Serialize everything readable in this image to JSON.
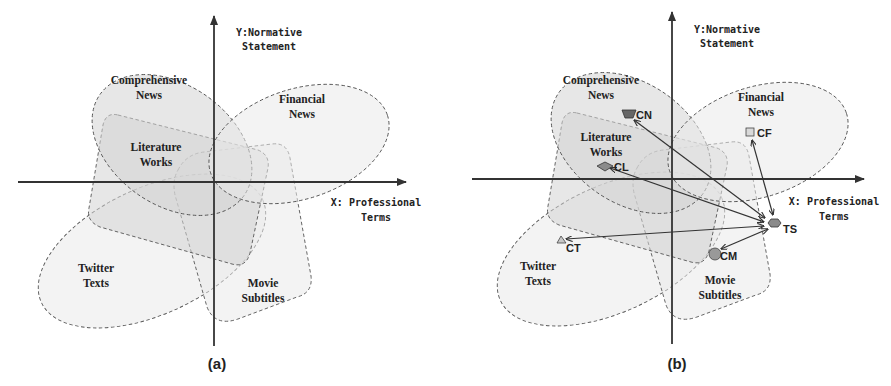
{
  "panels": [
    {
      "caption": "(a)",
      "y_axis_label": [
        "Y:Normative",
        "Statement"
      ],
      "x_axis_label": [
        "X: Professional",
        "Terms"
      ],
      "regions": [
        {
          "id": "comprehensive-news",
          "label": [
            "Comprehensive",
            "News"
          ]
        },
        {
          "id": "financial-news",
          "label": [
            "Financial",
            "News"
          ]
        },
        {
          "id": "literature-works",
          "label": [
            "Literature",
            "Works"
          ]
        },
        {
          "id": "twitter-texts",
          "label": [
            "Twitter",
            "Texts"
          ]
        },
        {
          "id": "movie-subtitles",
          "label": [
            "Movie",
            "Subtitles"
          ]
        }
      ]
    },
    {
      "caption": "(b)",
      "y_axis_label": [
        "Y:Normative",
        "Statement"
      ],
      "x_axis_label": [
        "X: Professional",
        "Terms"
      ],
      "regions": [
        {
          "id": "comprehensive-news",
          "label": [
            "Comprehensive",
            "News"
          ]
        },
        {
          "id": "financial-news",
          "label": [
            "Financial",
            "News"
          ]
        },
        {
          "id": "literature-works",
          "label": [
            "Literature",
            "Works"
          ]
        },
        {
          "id": "twitter-texts",
          "label": [
            "Twitter",
            "Texts"
          ]
        },
        {
          "id": "movie-subtitles",
          "label": [
            "Movie",
            "Subtitles"
          ]
        }
      ],
      "markers": [
        {
          "id": "CN",
          "label": "CN",
          "shape": "trapezoid",
          "color": "#666666"
        },
        {
          "id": "CF",
          "label": "CF",
          "shape": "square",
          "color": "#d9d9d9"
        },
        {
          "id": "CL",
          "label": "CL",
          "shape": "diamond",
          "color": "#8c8c8c"
        },
        {
          "id": "CT",
          "label": "CT",
          "shape": "triangle",
          "color": "#c8c8c8"
        },
        {
          "id": "CM",
          "label": "CM",
          "shape": "circle",
          "color": "#999999"
        },
        {
          "id": "TS",
          "label": "TS",
          "shape": "hexagon",
          "color": "#8a8a8a"
        }
      ],
      "arrows": [
        {
          "from": "TS",
          "to": "CN"
        },
        {
          "from": "TS",
          "to": "CF"
        },
        {
          "from": "TS",
          "to": "CL"
        },
        {
          "from": "TS",
          "to": "CT"
        },
        {
          "from": "TS",
          "to": "CM"
        }
      ]
    }
  ]
}
